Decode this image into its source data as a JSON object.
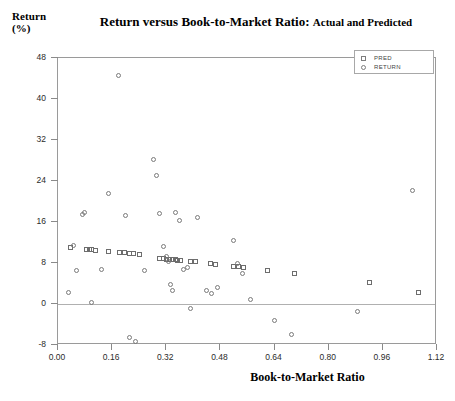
{
  "chart_data": {
    "type": "scatter",
    "title": "Return versus Book-to-Market Ratio:",
    "title_suffix": "Actual and Predicted",
    "xlabel": "Book-to-Market Ratio",
    "ylabel": "Return\n(%)",
    "xlim": [
      0.0,
      1.12
    ],
    "ylim": [
      -8,
      48
    ],
    "xticks": [
      "0.00",
      "0.16",
      "0.32",
      "0.48",
      "0.64",
      "0.80",
      "0.96",
      "1.12"
    ],
    "xtick_values": [
      0.0,
      0.16,
      0.32,
      0.48,
      0.64,
      0.8,
      0.96,
      1.12
    ],
    "yticks": [
      "48",
      "40",
      "32",
      "24",
      "16",
      "8",
      "0",
      "-8"
    ],
    "ytick_values": [
      48,
      40,
      32,
      24,
      16,
      8,
      0,
      -8
    ],
    "grid": false,
    "zero_line": true,
    "legend_position": "top-right",
    "marker_color": "#6d6d6d",
    "series": [
      {
        "name": "PRED",
        "marker": "square",
        "points": [
          [
            0.038,
            11.1
          ],
          [
            0.083,
            10.6
          ],
          [
            0.092,
            10.6
          ],
          [
            0.1,
            10.6
          ],
          [
            0.112,
            10.5
          ],
          [
            0.15,
            10.3
          ],
          [
            0.182,
            10.1
          ],
          [
            0.196,
            10.0
          ],
          [
            0.21,
            9.9
          ],
          [
            0.224,
            9.8
          ],
          [
            0.24,
            9.7
          ],
          [
            0.3,
            8.9
          ],
          [
            0.312,
            8.8
          ],
          [
            0.322,
            8.7
          ],
          [
            0.33,
            8.7
          ],
          [
            0.338,
            8.6
          ],
          [
            0.346,
            8.6
          ],
          [
            0.354,
            8.5
          ],
          [
            0.362,
            8.5
          ],
          [
            0.392,
            8.3
          ],
          [
            0.406,
            8.2
          ],
          [
            0.452,
            7.9
          ],
          [
            0.466,
            7.8
          ],
          [
            0.52,
            7.4
          ],
          [
            0.534,
            7.3
          ],
          [
            0.548,
            7.2
          ],
          [
            0.62,
            6.6
          ],
          [
            0.7,
            6.0
          ],
          [
            0.92,
            4.2
          ],
          [
            1.065,
            2.2
          ]
        ]
      },
      {
        "name": "RETURN",
        "marker": "circle",
        "points": [
          [
            0.03,
            2.2
          ],
          [
            0.045,
            11.5
          ],
          [
            0.055,
            6.6
          ],
          [
            0.072,
            17.4
          ],
          [
            0.078,
            17.9
          ],
          [
            0.098,
            0.2
          ],
          [
            0.13,
            6.8
          ],
          [
            0.15,
            21.6
          ],
          [
            0.178,
            44.5
          ],
          [
            0.2,
            17.2
          ],
          [
            0.21,
            -6.5
          ],
          [
            0.228,
            -7.4
          ],
          [
            0.255,
            6.6
          ],
          [
            0.282,
            28.2
          ],
          [
            0.292,
            25.0
          ],
          [
            0.3,
            17.6
          ],
          [
            0.312,
            11.3
          ],
          [
            0.32,
            9.3
          ],
          [
            0.326,
            8.2
          ],
          [
            0.332,
            3.8
          ],
          [
            0.338,
            2.6
          ],
          [
            0.346,
            17.8
          ],
          [
            0.36,
            16.3
          ],
          [
            0.372,
            6.7
          ],
          [
            0.382,
            7.2
          ],
          [
            0.392,
            -0.8
          ],
          [
            0.412,
            16.9
          ],
          [
            0.44,
            2.7
          ],
          [
            0.455,
            2.0
          ],
          [
            0.47,
            3.3
          ],
          [
            0.52,
            12.4
          ],
          [
            0.53,
            8.0
          ],
          [
            0.546,
            6.0
          ],
          [
            0.57,
            0.9
          ],
          [
            0.64,
            -3.3
          ],
          [
            0.69,
            -6.0
          ],
          [
            0.885,
            -1.4
          ],
          [
            1.048,
            22.2
          ]
        ]
      }
    ]
  },
  "legend": {
    "items": [
      {
        "label": "PRED",
        "marker": "square"
      },
      {
        "label": "RETURN",
        "marker": "circle"
      }
    ]
  }
}
